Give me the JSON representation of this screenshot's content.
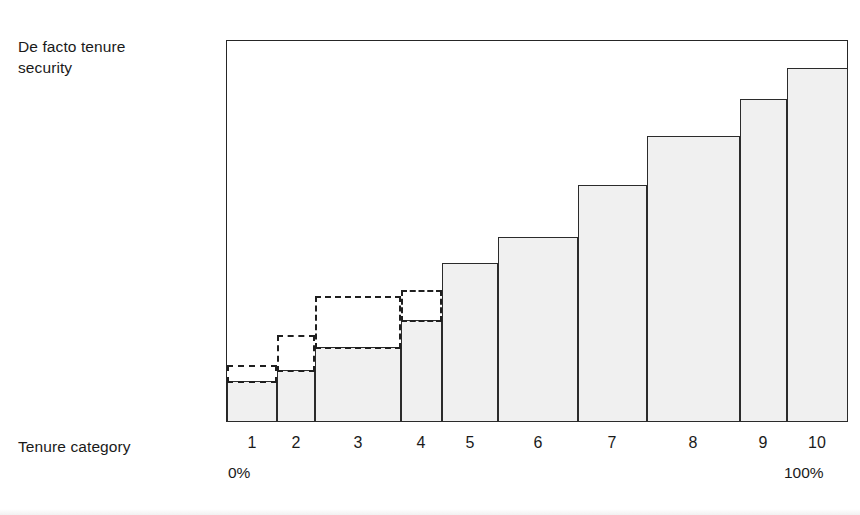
{
  "figure": {
    "y_axis_label": "De facto tenure\nsecurity",
    "x_axis_label": "Tenure category",
    "scale_start": "0%",
    "scale_end": "100%"
  },
  "chart_data": {
    "type": "bar",
    "title": "",
    "subtitle": "",
    "xlabel": "Tenure category",
    "ylabel": "De facto tenure security",
    "grid": false,
    "legend": null,
    "axis_notes": {
      "x_scale_start_label": "0%",
      "x_scale_end_label": "100%",
      "y_axis_ticks": [],
      "x_axis_ticks": [
        "1",
        "2",
        "3",
        "4",
        "5",
        "6",
        "7",
        "8",
        "9",
        "10"
      ]
    },
    "ylim": [
      0,
      100
    ],
    "categories": [
      "1",
      "2",
      "3",
      "4",
      "5",
      "6",
      "7",
      "8",
      "9",
      "10"
    ],
    "series": [
      {
        "name": "De facto tenure security (solid bar)",
        "style": "solid-filled",
        "values": [
          11,
          14,
          20,
          27,
          42,
          48,
          62,
          75,
          85,
          93
        ]
      },
      {
        "name": "Potential / perceived security (dashed extension)",
        "style": "dashed-outline",
        "values": [
          15,
          23,
          33,
          35,
          null,
          null,
          null,
          null,
          null,
          null
        ]
      }
    ],
    "category_widths_percent": [
      8.0,
      6.1,
      13.8,
      6.6,
      9.0,
      12.9,
      11.1,
      14.9,
      7.6,
      9.8
    ],
    "annotations": [
      "Bars 1-4 carry a dashed-outline rectangle rising above the solid bar top.",
      "Bar widths vary; together they span 0% to 100% of the tenure population."
    ]
  },
  "colors": {
    "bar_fill": "#f0f0f0",
    "bar_stroke": "#2b2b2b",
    "dashed_stroke": "#1f1f1f",
    "frame_stroke": "#262626",
    "text": "#1a1a1a",
    "background": "#ffffff"
  },
  "geometry": {
    "plot": {
      "left": 226,
      "top": 40,
      "width": 622,
      "height": 382
    },
    "bar_edges_px": [
      227,
      277,
      315,
      401,
      442,
      498,
      578,
      647,
      740,
      787,
      848
    ],
    "bar_top_px": [
      381,
      370,
      347,
      320,
      263,
      237,
      185,
      136,
      99,
      68
    ],
    "dashed_top_px": [
      365,
      335,
      296,
      290,
      null,
      null,
      null,
      null,
      null,
      null
    ],
    "tick_centers_px": [
      252,
      296,
      358,
      421,
      470,
      538,
      612,
      693,
      763,
      817
    ]
  }
}
